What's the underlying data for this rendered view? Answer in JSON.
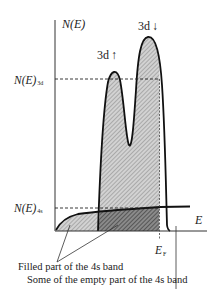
{
  "diagram": {
    "type": "density-of-states",
    "y_axis_label": "N(E)",
    "x_axis_label": "E",
    "bands": {
      "d_up": {
        "label": "3d",
        "arrow": "↑"
      },
      "d_down": {
        "label": "3d",
        "arrow": "↓"
      }
    },
    "levels": {
      "n3d": {
        "prefix": "N(E)",
        "sub": "3d"
      },
      "n4s": {
        "prefix": "N(E)",
        "sub": "4s"
      }
    },
    "fermi": {
      "label": "E",
      "sub": "F"
    },
    "annotations": {
      "filled_4s": "Filled part of the 4s band",
      "empty_4s": "Some of the empty part of the 4s band"
    },
    "colors": {
      "line": "#111111",
      "hatch_light": "#9a9a9a",
      "hatch_dark": "#4a4a4a",
      "fill_light": "#d4d4d4",
      "fill_dark": "#8c8c8c"
    }
  }
}
